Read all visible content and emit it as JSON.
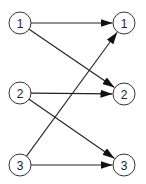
{
  "diagram": {
    "type": "bipartite-mapping",
    "left_nodes": [
      {
        "id": "L1",
        "label": "1",
        "x": 20,
        "y": 23
      },
      {
        "id": "L2",
        "label": "2",
        "x": 20,
        "y": 93
      },
      {
        "id": "L3",
        "label": "3",
        "x": 20,
        "y": 165
      }
    ],
    "right_nodes": [
      {
        "id": "R1",
        "label": "1",
        "x": 124,
        "y": 23
      },
      {
        "id": "R2",
        "label": "2",
        "x": 124,
        "y": 94
      },
      {
        "id": "R3",
        "label": "3",
        "x": 124,
        "y": 165
      }
    ],
    "edges": [
      {
        "from": "L1",
        "to": "R1"
      },
      {
        "from": "L1",
        "to": "R2"
      },
      {
        "from": "L2",
        "to": "R2"
      },
      {
        "from": "L2",
        "to": "R3"
      },
      {
        "from": "L3",
        "to": "R1"
      },
      {
        "from": "L3",
        "to": "R3"
      }
    ],
    "node_radius": 11,
    "colors": {
      "stroke": "#333333",
      "fill": "#ffffff",
      "text": "#222222"
    }
  }
}
